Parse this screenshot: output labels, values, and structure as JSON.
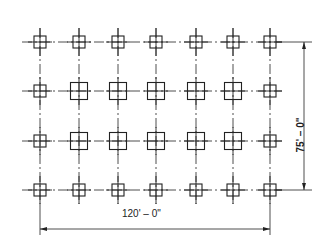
{
  "diagram": {
    "type": "column grid plan",
    "grid": {
      "columns": 7,
      "rows": 4,
      "column_x": [
        40,
        79,
        118,
        156,
        196,
        233,
        270
      ],
      "row_y": [
        42,
        91,
        141,
        190
      ],
      "small_column_size": 12,
      "large_column_size": 17,
      "large_columns": [
        [
          1,
          1
        ],
        [
          1,
          2
        ],
        [
          1,
          3
        ],
        [
          1,
          4
        ],
        [
          1,
          5
        ],
        [
          2,
          1
        ],
        [
          2,
          2
        ],
        [
          2,
          3
        ],
        [
          2,
          4
        ],
        [
          2,
          5
        ]
      ]
    },
    "dimensions": {
      "horizontal": "120' – 0\"",
      "vertical": "75' – 0\""
    },
    "colors": {
      "line": "#222222",
      "background": "#ffffff"
    }
  }
}
